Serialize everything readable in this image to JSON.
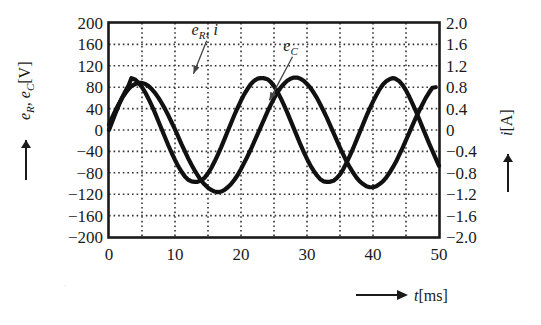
{
  "chart_data": {
    "type": "line",
    "title": "",
    "xlabel": "t [ms]",
    "ylabel": "e_R, e_C [V]",
    "y2label": "i [A]",
    "xlim": [
      0,
      50
    ],
    "ylim": [
      -200,
      200
    ],
    "y2lim": [
      -2.0,
      2.0
    ],
    "grid": true,
    "grid_x_step": 5,
    "grid_y_step": 40,
    "legend_position": "inline-annotations",
    "x_ticks": [
      "0",
      "10",
      "20",
      "30",
      "40",
      "50"
    ],
    "x_tick_values": [
      0,
      10,
      20,
      30,
      40,
      50
    ],
    "y_ticks": [
      "200",
      "160",
      "120",
      "80",
      "40",
      "0",
      "-40",
      "-80",
      "-120",
      "-160",
      "-200"
    ],
    "y_tick_values": [
      200,
      160,
      120,
      80,
      40,
      0,
      -40,
      -80,
      -120,
      -160,
      -200
    ],
    "y2_ticks": [
      "2.0",
      "1.6",
      "1.2",
      "0.8",
      "0.4",
      "0",
      "-0.4",
      "-0.8",
      "-1.2",
      "-1.6",
      "-2.0"
    ],
    "y2_tick_values": [
      2.0,
      1.6,
      1.2,
      0.8,
      0.4,
      0,
      -0.4,
      -0.8,
      -1.2,
      -1.6,
      -2.0
    ],
    "annotations": [
      {
        "label": "e_R , i",
        "base": "e",
        "sub": "R",
        "tail": ", i",
        "x_text": 14.5,
        "y_text": 178,
        "x_point": 12.8,
        "y_point": 96
      },
      {
        "label": "e_C",
        "base": "e",
        "sub": "C",
        "tail": "",
        "x_text": 27.5,
        "y_text": 148,
        "x_point": 24.3,
        "y_point": 46
      }
    ],
    "series": [
      {
        "name": "e_R , i",
        "axis": "left",
        "waveform": "sine",
        "amplitude": 97,
        "period_ms": 20,
        "phase_deg": 0,
        "offset": 0,
        "start_value": 0,
        "peak_time_ms": 3.4,
        "peak_value": 97,
        "trough_time_ms": 13.4,
        "trough_value": -97,
        "end_time_ms": 50,
        "end_value": -82,
        "color": "#111111",
        "line_width": 4.2,
        "points_t": [
          0,
          0.5,
          1,
          1.5,
          2,
          2.5,
          3,
          3.4,
          4,
          4.5,
          5,
          5.5,
          6,
          6.5,
          7,
          7.5,
          8,
          8.5,
          9,
          9.5,
          10,
          10.5,
          11,
          11.5,
          12,
          12.5,
          13,
          13.4,
          14,
          14.5,
          15,
          15.5,
          16,
          16.5,
          17,
          17.5,
          18,
          18.5,
          19,
          19.5,
          20,
          20.5,
          21,
          21.5,
          22,
          22.5,
          23,
          23.4,
          24,
          24.5,
          25,
          25.5,
          26,
          26.5,
          27,
          27.5,
          28,
          28.5,
          29,
          29.5,
          30,
          30.5,
          31,
          31.5,
          32,
          32.5,
          33,
          33.4,
          34,
          34.5,
          35,
          35.5,
          36,
          36.5,
          37,
          37.5,
          38,
          38.5,
          39,
          39.5,
          40,
          40.5,
          41,
          41.5,
          42,
          42.5,
          43,
          43.4,
          44,
          44.5,
          45,
          45.5,
          46,
          46.5,
          47,
          47.5,
          48,
          48.5,
          49,
          49.5,
          50
        ],
        "points_v": [
          0,
          16,
          32,
          47,
          61,
          73,
          84,
          97,
          94,
          88,
          80,
          70,
          58,
          45,
          31,
          16,
          1,
          -14,
          -29,
          -43,
          -56,
          -68,
          -78,
          -87,
          -93,
          -96,
          -97,
          -97,
          -94,
          -89,
          -81,
          -71,
          -59,
          -46,
          -32,
          -17,
          -2,
          13,
          28,
          42,
          55,
          67,
          77,
          86,
          92,
          96,
          97,
          97,
          95,
          90,
          82,
          72,
          60,
          47,
          33,
          18,
          3,
          -12,
          -27,
          -41,
          -54,
          -66,
          -76,
          -85,
          -92,
          -96,
          -97,
          -97,
          -95,
          -90,
          -83,
          -73,
          -61,
          -48,
          -34,
          -19,
          -4,
          11,
          26,
          40,
          53,
          65,
          76,
          85,
          91,
          95,
          97,
          96,
          91,
          84,
          74,
          62,
          49,
          35,
          20,
          5,
          -10,
          -25,
          -39,
          -53,
          -67,
          -82
        ]
      },
      {
        "name": "e_C",
        "axis": "left",
        "waveform": "sine",
        "amplitude": 105,
        "period_ms": 20,
        "phase_deg": -70,
        "offset": -14,
        "start_value": 10,
        "peak_time_ms": 7.5,
        "peak_value": 88,
        "trough_time_ms": 13.0,
        "trough_value": -121,
        "end_time_ms": 50,
        "end_value": 80,
        "color": "#111111",
        "line_width": 4.2,
        "points_t": [
          0,
          0.5,
          1,
          1.5,
          2,
          2.5,
          3,
          3.5,
          4,
          4.5,
          5,
          5.5,
          6,
          6.5,
          7,
          7.5,
          8,
          8.5,
          9,
          9.5,
          10,
          10.5,
          11,
          11.5,
          12,
          12.5,
          13,
          13.5,
          14,
          14.5,
          15,
          15.5,
          16,
          16.5,
          17,
          17.5,
          18,
          18.5,
          19,
          19.5,
          20,
          20.5,
          21,
          21.5,
          22,
          22.5,
          23,
          23.5,
          24,
          24.5,
          25,
          25.5,
          26,
          26.5,
          27,
          27.5,
          28,
          28.5,
          29,
          29.5,
          30,
          30.5,
          31,
          31.5,
          32,
          32.5,
          33,
          33.5,
          34,
          34.5,
          35,
          35.5,
          36,
          36.5,
          37,
          37.5,
          38,
          38.5,
          39,
          39.5,
          40,
          40.5,
          41,
          41.5,
          42,
          42.5,
          43,
          43.5,
          44,
          44.5,
          45,
          45.5,
          46,
          46.5,
          47,
          47.5,
          48,
          48.5,
          49,
          49.5,
          50
        ],
        "points_v": [
          10,
          24,
          37,
          49,
          60,
          69,
          77,
          83,
          86,
          88,
          88,
          86,
          82,
          76,
          69,
          60,
          50,
          39,
          27,
          14,
          1,
          -13,
          -27,
          -40,
          -53,
          -65,
          -76,
          -86,
          -95,
          -102,
          -108,
          -112,
          -115,
          -116,
          -115,
          -112,
          -107,
          -101,
          -93,
          -84,
          -73,
          -61,
          -49,
          -36,
          -22,
          -8,
          6,
          20,
          34,
          47,
          59,
          70,
          79,
          86,
          92,
          96,
          98,
          98,
          96,
          92,
          86,
          79,
          70,
          60,
          48,
          36,
          23,
          9,
          -5,
          -19,
          -33,
          -46,
          -59,
          -70,
          -80,
          -89,
          -96,
          -101,
          -105,
          -107,
          -107,
          -105,
          -101,
          -96,
          -89,
          -80,
          -70,
          -59,
          -46,
          -33,
          -19,
          -5,
          9,
          23,
          36,
          48,
          60,
          70,
          79,
          80
        ]
      }
    ]
  },
  "axes": {
    "left_label_main": "e",
    "left_label_sub1": "R",
    "left_label_mid": ", e",
    "left_label_sub2": "C",
    "left_label_unit": "[V]",
    "right_label_main": "i",
    "right_label_unit": "[A]",
    "bottom_label_main": "t",
    "bottom_label_unit": "[ms]"
  },
  "colors": {
    "curve": "#111111",
    "frame": "#1a1a1a",
    "grid": "#333333",
    "background": "#ffffff",
    "leader": "#444444"
  }
}
